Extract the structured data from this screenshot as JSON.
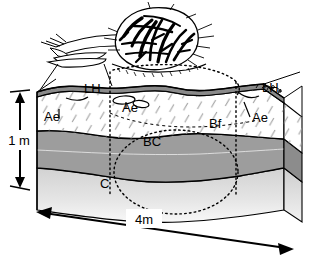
{
  "figure": {
    "type": "soil-profile-block-diagram",
    "title": ""
  },
  "horizons": [
    {
      "id": "LH",
      "label": "LH",
      "description": "Forest floor organic layer at the soil surface",
      "color": "#8f8f8f"
    },
    {
      "id": "Ae",
      "label": "Ae",
      "description": "Eluviated light-coloured mineral horizon with hatch pattern",
      "color": "#ffffff"
    },
    {
      "id": "Bf",
      "label": "Bf",
      "description": "Illuvial B horizon within the hatched zone",
      "color": "#ffffff"
    },
    {
      "id": "BC",
      "label": "BC",
      "description": "Transitional horizon, medium grey",
      "color": "#9d9d9d"
    },
    {
      "id": "C",
      "label": "C",
      "description": "Parent material, light grey",
      "color": "#d8d8d8"
    }
  ],
  "labels": [
    {
      "key": "lh_left",
      "text": "LH",
      "x": 84,
      "y": 93
    },
    {
      "key": "lh_right",
      "text": "LH",
      "x": 262,
      "y": 92
    },
    {
      "key": "ae_left",
      "text": "Ae",
      "x": 44,
      "y": 121
    },
    {
      "key": "ae_mid",
      "text": "Ae",
      "x": 122,
      "y": 112
    },
    {
      "key": "ae_right",
      "text": "Ae",
      "x": 252,
      "y": 122
    },
    {
      "key": "bf",
      "text": "Bf",
      "x": 209,
      "y": 128
    },
    {
      "key": "bc",
      "text": "BC",
      "x": 143,
      "y": 146
    },
    {
      "key": "c",
      "text": "C",
      "x": 100,
      "y": 188
    }
  ],
  "scales": {
    "vertical": {
      "label": "1 m",
      "orientation": "vertical",
      "arrow": "double-headed"
    },
    "horizontal": {
      "label": "4m",
      "orientation": "horizontal",
      "arrow": "double-headed"
    }
  },
  "annotations": {
    "tree": "uprooted-tree-with-root-plate",
    "dotted_upper_arc": "root-plate disturbance outline above ground",
    "dotted_circle": "subsurface root-plate disturbance outline",
    "dotted_vertical_left": "left boundary of disturbance zone",
    "dotted_vertical_right": "right boundary of disturbance zone"
  },
  "colors": {
    "outline": "#000000",
    "lh_band": "#8a8a8a",
    "bc_fill": "#9d9d9d",
    "c_fill": "#dcdcdc",
    "ae_fill": "#ffffff",
    "side_face_dark": "#8c8c8c",
    "background": "#ffffff"
  }
}
